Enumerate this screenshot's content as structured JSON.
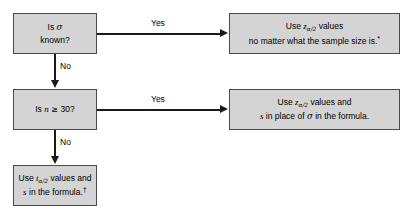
{
  "diagram": {
    "type": "flowchart",
    "background_color": "#ffffff",
    "node_fill_color": "#d4d4d4",
    "node_border_color": "#4a4a4a",
    "connector_color": "#1a1a1a"
  },
  "nodes": {
    "sigma_known": {
      "shape": "decision",
      "line1": "Is ",
      "symbol1": "σ",
      "line2": "known?"
    },
    "n_ge_30": {
      "shape": "decision",
      "prefix": "Is ",
      "symbol": "n",
      "relation": "≥",
      "value": "30?"
    },
    "use_z_any_size": {
      "shape": "process",
      "line1_prefix": "Use ",
      "line1_symbol": "z",
      "line1_subscript": "α/2",
      "line1_suffix": " values",
      "line2": "no matter what the sample size is.",
      "line2_mark": "*"
    },
    "use_z_with_s": {
      "shape": "process",
      "line1_prefix": "Use ",
      "line1_symbol": "z",
      "line1_subscript": "α/2",
      "line1_suffix": " values and",
      "line2_symbol1": "s",
      "line2_mid": " in place of ",
      "line2_symbol2": "σ",
      "line2_suffix": " in the formula."
    },
    "use_t": {
      "shape": "process",
      "line1_prefix": "Use ",
      "line1_symbol": "t",
      "line1_subscript": "α/2",
      "line1_suffix": " values and",
      "line2_symbol": "s",
      "line2_suffix": " in the formula.",
      "line2_mark": "†"
    }
  },
  "edges": {
    "sigma_known_yes": {
      "label": "Yes",
      "direction": "right"
    },
    "sigma_known_no": {
      "label": "No",
      "direction": "down"
    },
    "n_ge_30_yes": {
      "label": "Yes",
      "direction": "right"
    },
    "n_ge_30_no": {
      "label": "No",
      "direction": "down"
    }
  }
}
